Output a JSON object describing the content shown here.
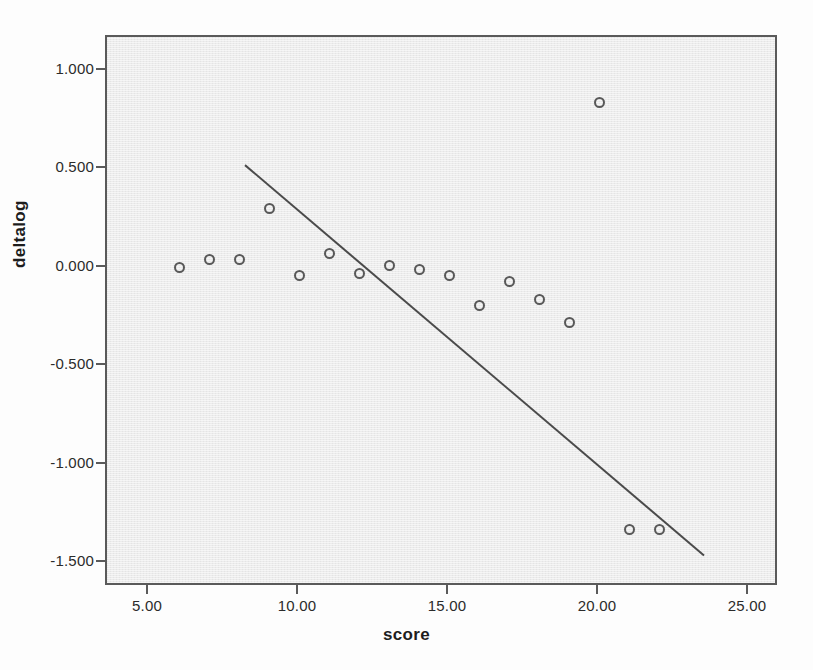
{
  "chart_data": {
    "type": "scatter",
    "title": "",
    "xlabel": "score",
    "ylabel": "deltalog",
    "xlim": [
      3.6,
      26.0
    ],
    "ylim": [
      -1.62,
      1.17
    ],
    "xticks": [
      5,
      10,
      15,
      20,
      25
    ],
    "xticklabels": [
      "5.00",
      "10.00",
      "15.00",
      "20.00",
      "25.00"
    ],
    "yticks": [
      1.0,
      0.5,
      0.0,
      -0.5,
      -1.0,
      -1.5
    ],
    "yticklabels": [
      "1.000",
      "0.500",
      "0.000",
      "-0.500",
      "-1.000",
      "-1.500"
    ],
    "grid": false,
    "legend": null,
    "marker_style": "open-circle",
    "panel_color": "#ececec",
    "marker_color": "#585858",
    "line_color": "#4a4a4a",
    "points": [
      {
        "x": 6,
        "y": 0.0
      },
      {
        "x": 7,
        "y": 0.04
      },
      {
        "x": 8,
        "y": 0.04
      },
      {
        "x": 9,
        "y": 0.3
      },
      {
        "x": 10,
        "y": -0.04
      },
      {
        "x": 11,
        "y": 0.07
      },
      {
        "x": 12,
        "y": -0.03
      },
      {
        "x": 13,
        "y": 0.01
      },
      {
        "x": 14,
        "y": -0.01
      },
      {
        "x": 15,
        "y": -0.04
      },
      {
        "x": 16,
        "y": -0.19
      },
      {
        "x": 17,
        "y": -0.07
      },
      {
        "x": 18,
        "y": -0.16
      },
      {
        "x": 19,
        "y": -0.28
      },
      {
        "x": 20,
        "y": 0.84
      },
      {
        "x": 21,
        "y": -1.33
      },
      {
        "x": 22,
        "y": -1.33
      }
    ],
    "fit_line": {
      "name": "linear-fit",
      "x_start": 8.2,
      "y_start": 0.52,
      "x_end": 23.5,
      "y_end": -1.46
    }
  }
}
